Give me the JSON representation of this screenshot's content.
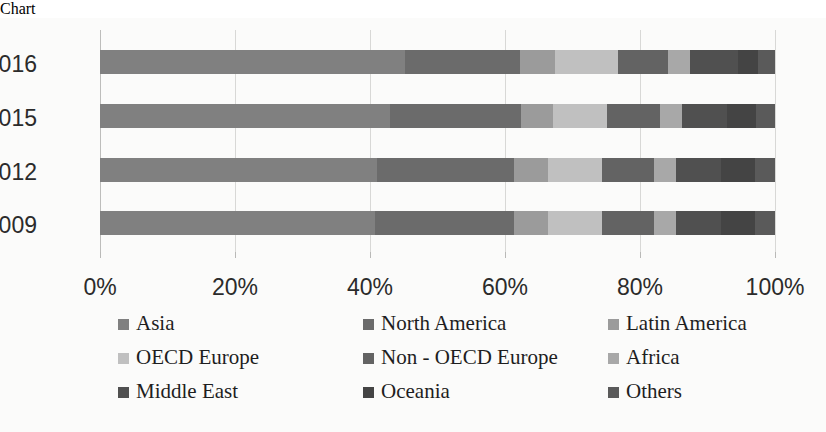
{
  "chart_data": {
    "type": "bar",
    "orientation": "horizontal",
    "stacked": true,
    "stack_mode": "percent",
    "title": "",
    "subtitle": "",
    "xlabel": "",
    "ylabel": "",
    "xlim": [
      0,
      100
    ],
    "xtick_labels": [
      "0%",
      "20%",
      "40%",
      "60%",
      "80%",
      "100%"
    ],
    "xticks": [
      0,
      20,
      40,
      60,
      80,
      100
    ],
    "grid": true,
    "grid_axis": "x",
    "legend_position": "bottom",
    "categories": [
      "2016",
      "2015",
      "2012",
      "2009"
    ],
    "series": [
      {
        "name": "Asia",
        "color": "#808080",
        "values": [
          45.2,
          43.0,
          41.0,
          40.8
        ]
      },
      {
        "name": "North America",
        "color": "#6b6b6b",
        "values": [
          17.0,
          19.3,
          20.3,
          20.5
        ]
      },
      {
        "name": "Latin America",
        "color": "#9b9b9b",
        "values": [
          5.2,
          4.8,
          5.0,
          5.0
        ]
      },
      {
        "name": "OECD Europe",
        "color": "#c0c0c0",
        "values": [
          9.3,
          8.0,
          8.0,
          8.0
        ]
      },
      {
        "name": "Non - OECD Europe",
        "color": "#636363",
        "values": [
          7.4,
          7.8,
          7.8,
          7.8
        ]
      },
      {
        "name": "Africa",
        "color": "#a8a8a8",
        "values": [
          3.3,
          3.3,
          3.3,
          3.3
        ]
      },
      {
        "name": "Middle East",
        "color": "#505050",
        "values": [
          7.1,
          6.7,
          6.6,
          6.6
        ]
      },
      {
        "name": "Oceania",
        "color": "#444444",
        "values": [
          3.0,
          4.3,
          5.0,
          5.0
        ]
      },
      {
        "name": "Others",
        "color": "#5a5a5a",
        "values": [
          2.5,
          2.8,
          3.0,
          3.0
        ]
      }
    ]
  },
  "legend": {
    "items": [
      {
        "label": "Asia",
        "color": "#808080"
      },
      {
        "label": "North America",
        "color": "#6b6b6b"
      },
      {
        "label": "Latin America",
        "color": "#9b9b9b"
      },
      {
        "label": "OECD Europe",
        "color": "#c0c0c0"
      },
      {
        "label": "Non - OECD Europe",
        "color": "#636363"
      },
      {
        "label": "Africa",
        "color": "#a8a8a8"
      },
      {
        "label": "Middle East",
        "color": "#505050"
      },
      {
        "label": "Oceania",
        "color": "#444444"
      },
      {
        "label": "Others",
        "color": "#5a5a5a"
      }
    ]
  }
}
